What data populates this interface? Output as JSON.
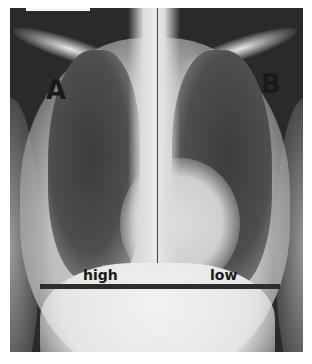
{
  "image": {
    "subject": "Frontal chest X-ray",
    "labels": {
      "left": "A",
      "right": "B",
      "left_diaphragm": "high",
      "right_diaphragm": "low"
    },
    "colors": {
      "film_dark": "#2a2a2a",
      "bone_light": "#e6e6e6",
      "label_text": "#1a1a1a",
      "rule_line": "#2e2e2e"
    }
  }
}
